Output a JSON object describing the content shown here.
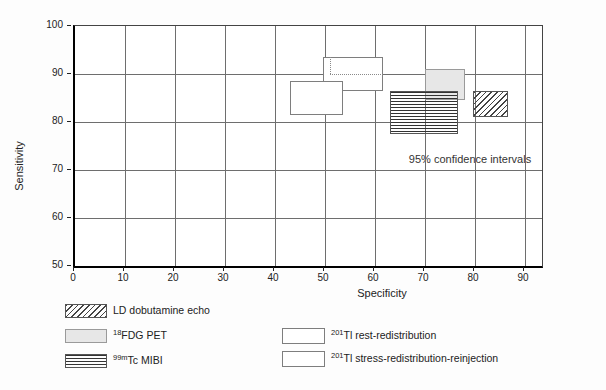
{
  "figure": {
    "xlabel": "Specificity",
    "ylabel": "Sensitivity",
    "annotation": "95% confidence intervals"
  },
  "chart_data": {
    "type": "confidence-interval-boxes",
    "title": "",
    "xlabel": "Specificity",
    "ylabel": "Sensitivity",
    "xlim": [
      0,
      93
    ],
    "ylim": [
      50,
      100
    ],
    "x_ticks": [
      0,
      10,
      20,
      30,
      40,
      50,
      60,
      70,
      80,
      90
    ],
    "y_ticks": [
      100,
      90,
      80,
      70,
      60,
      50
    ],
    "grid": true,
    "annotation": "95% confidence intervals",
    "series": [
      {
        "name": "201Tl rest-redistribution",
        "pattern": "white",
        "specificity_range": [
          49.5,
          61.5
        ],
        "sensitivity_range": [
          86.5,
          93.5
        ],
        "hidden_edges": {
          "x": 51,
          "y": 90
        }
      },
      {
        "name": "201Tl stress-redistribution-reinjection",
        "pattern": "white",
        "specificity_range": [
          43,
          53.5
        ],
        "sensitivity_range": [
          81.5,
          88.5
        ]
      },
      {
        "name": "18FDG PET",
        "pattern": "gray",
        "specificity_range": [
          70,
          78
        ],
        "sensitivity_range": [
          84.5,
          91
        ]
      },
      {
        "name": "99mTc MIBI",
        "pattern": "hstripes",
        "specificity_range": [
          63,
          76.5
        ],
        "sensitivity_range": [
          77.5,
          86.5
        ]
      },
      {
        "name": "LD dobutamine echo",
        "pattern": "dhatch",
        "specificity_range": [
          79.5,
          86.5
        ],
        "sensitivity_range": [
          81,
          86.5
        ]
      }
    ]
  },
  "legend": {
    "items": [
      {
        "sup": "",
        "main": "LD dobutamine echo",
        "pattern": "dhatch"
      },
      {
        "sup": "18",
        "main": "FDG PET",
        "pattern": "gray"
      },
      {
        "sup": "99m",
        "main": "Tc MIBI",
        "pattern": "hstripes"
      },
      {
        "sup": "201",
        "main": "Tl rest-redistribution",
        "pattern": "white"
      },
      {
        "sup": "201",
        "main": "Tl stress-redistribution-reinjection",
        "pattern": "white"
      }
    ]
  },
  "colors": {
    "grid": "#6e6e6e",
    "white_box_border": "#7e7e7e",
    "gray_fill": "#e7e7e7",
    "stripe_line": "#333333",
    "hatch_line": "#444444"
  }
}
